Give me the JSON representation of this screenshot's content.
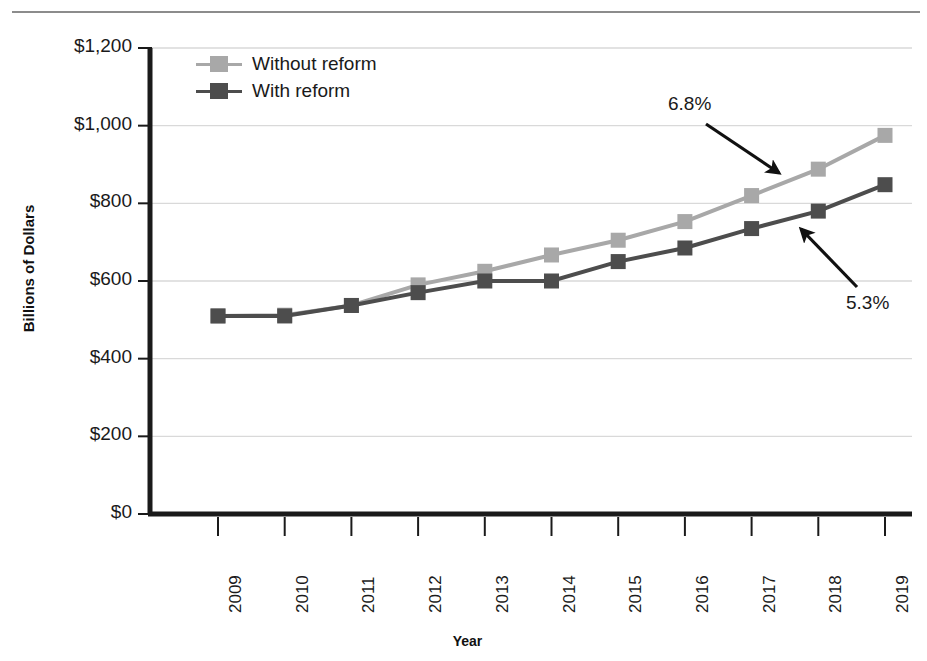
{
  "chart_data": {
    "type": "line",
    "title": "",
    "xlabel": "Year",
    "ylabel": "Billions of Dollars",
    "categories": [
      "2009",
      "2010",
      "2011",
      "2012",
      "2013",
      "2014",
      "2015",
      "2016",
      "2017",
      "2018",
      "2019"
    ],
    "ylim": [
      0,
      1200
    ],
    "yticks": [
      0,
      200,
      400,
      600,
      800,
      1000,
      1200
    ],
    "ytick_labels": [
      "$0",
      "$200",
      "$400",
      "$600",
      "$800",
      "$1,000",
      "$1,200"
    ],
    "grid": "horizontal",
    "legend_position": "top-left-inside",
    "series": [
      {
        "name": "Without reform",
        "color": "#a8a8a8",
        "values": [
          510,
          512,
          537,
          590,
          625,
          667,
          705,
          753,
          820,
          888,
          975
        ]
      },
      {
        "name": "With reform",
        "color": "#4d4d4d",
        "values": [
          510,
          510,
          537,
          570,
          600,
          600,
          650,
          685,
          735,
          780,
          848
        ]
      }
    ],
    "annotations": [
      {
        "id": "growth-without-reform",
        "text": "6.8%",
        "target_series": "Without reform"
      },
      {
        "id": "growth-with-reform",
        "text": "5.3%",
        "target_series": "With reform"
      }
    ]
  },
  "legend": {
    "items": [
      {
        "label": "Without reform",
        "color": "#a8a8a8"
      },
      {
        "label": "With reform",
        "color": "#4d4d4d"
      }
    ]
  },
  "axes": {
    "y_title": "Billions of Dollars",
    "x_title": "Year"
  },
  "colors": {
    "without_reform": "#a8a8a8",
    "with_reform": "#4d4d4d",
    "axis": "#1a1a1a",
    "grid": "#d9d9d9",
    "rule": "#8c8c8c"
  }
}
